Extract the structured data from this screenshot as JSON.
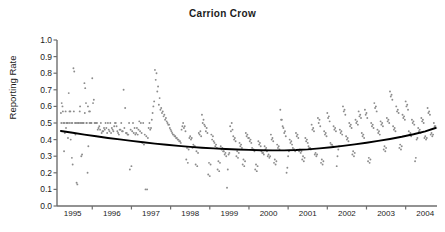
{
  "chart_data": {
    "type": "scatter",
    "title": "Carrion Crow",
    "xlabel": "",
    "ylabel": "Reporting Rate",
    "ylim": [
      0.0,
      1.0
    ],
    "xlim": [
      1994.6,
      2004.3
    ],
    "grid": false,
    "legend": null,
    "yticks": [
      "1.0",
      "0.9",
      "0.8",
      "0.7",
      "0.6",
      "0.5",
      "0.4",
      "0.3",
      "0.2",
      "0.1",
      "0.0"
    ],
    "ytick_values": [
      1.0,
      0.9,
      0.8,
      0.7,
      0.6,
      0.5,
      0.4,
      0.3,
      0.2,
      0.1,
      0.0
    ],
    "xticks": [
      "1995",
      "1996",
      "1997",
      "1998",
      "1999",
      "2000",
      "2001",
      "2002",
      "2003",
      "2004"
    ],
    "xtick_values": [
      1995,
      1996,
      1997,
      1998,
      1999,
      2000,
      2001,
      2002,
      2003,
      2004
    ],
    "point_color": "#8c8c8c",
    "trend_color": "#000000",
    "axis_color": "#6e6e6e",
    "series": [
      {
        "name": "Reporting rate (monthly observations)",
        "type": "scatter",
        "x": [
          1994.7,
          1994.72,
          1994.74,
          1994.76,
          1994.78,
          1994.8,
          1994.82,
          1994.84,
          1994.86,
          1994.88,
          1994.9,
          1994.92,
          1994.94,
          1994.96,
          1994.98,
          1995.0,
          1995.02,
          1995.04,
          1995.06,
          1995.08,
          1995.1,
          1995.12,
          1995.14,
          1995.16,
          1995.18,
          1995.2,
          1995.22,
          1995.24,
          1995.26,
          1995.28,
          1995.3,
          1995.32,
          1995.34,
          1995.36,
          1995.38,
          1995.4,
          1995.42,
          1995.44,
          1995.46,
          1995.48,
          1995.5,
          1995.54,
          1995.58,
          1995.62,
          1995.66,
          1995.7,
          1995.74,
          1995.78,
          1995.82,
          1995.86,
          1995.9,
          1995.94,
          1995.98,
          1996.02,
          1996.06,
          1996.1,
          1996.14,
          1996.18,
          1996.22,
          1996.26,
          1996.3,
          1996.34,
          1996.38,
          1996.42,
          1996.46,
          1996.5,
          1996.54,
          1996.58,
          1996.62,
          1996.66,
          1996.7,
          1996.74,
          1996.78,
          1996.82,
          1996.86,
          1996.9,
          1996.94,
          1996.98,
          1997.02,
          1997.06,
          1997.1,
          1997.14,
          1997.18,
          1997.22,
          1997.26,
          1997.3,
          1997.34,
          1997.38,
          1997.42,
          1997.46,
          1997.5,
          1997.54,
          1997.58,
          1997.62,
          1997.66,
          1997.7,
          1997.74,
          1997.78,
          1997.82,
          1997.86,
          1997.9,
          1997.94,
          1997.98,
          1998.02,
          1998.06,
          1998.1,
          1998.14,
          1998.18,
          1998.22,
          1998.26,
          1998.3,
          1998.34,
          1998.38,
          1998.42,
          1998.46,
          1998.5,
          1998.54,
          1998.58,
          1998.62,
          1998.66,
          1998.7,
          1998.74,
          1998.78,
          1998.82,
          1998.86,
          1998.9,
          1998.94,
          1998.98,
          1999.02,
          1999.06,
          1999.1,
          1999.14,
          1999.18,
          1999.22,
          1999.26,
          1999.3,
          1999.34,
          1999.38,
          1999.42,
          1999.46,
          1999.5,
          1999.54,
          1999.58,
          1999.62,
          1999.66,
          1999.7,
          1999.74,
          1999.78,
          1999.82,
          1999.86,
          1999.9,
          1999.94,
          1999.98,
          2000.02,
          2000.06,
          2000.1,
          2000.14,
          2000.18,
          2000.22,
          2000.26,
          2000.3,
          2000.34,
          2000.38,
          2000.42,
          2000.46,
          2000.5,
          2000.54,
          2000.58,
          2000.62,
          2000.66,
          2000.7,
          2000.74,
          2000.78,
          2000.82,
          2000.86,
          2000.9,
          2000.94,
          2000.98,
          2001.02,
          2001.06,
          2001.1,
          2001.14,
          2001.18,
          2001.22,
          2001.26,
          2001.3,
          2001.34,
          2001.38,
          2001.42,
          2001.46,
          2001.5,
          2001.54,
          2001.58,
          2001.62,
          2001.66,
          2001.7,
          2001.74,
          2001.78,
          2001.82,
          2001.86,
          2001.9,
          2001.94,
          2001.98,
          2002.02,
          2002.06,
          2002.1,
          2002.14,
          2002.18,
          2002.22,
          2002.26,
          2002.3,
          2002.34,
          2002.38,
          2002.42,
          2002.46,
          2002.5,
          2002.54,
          2002.58,
          2002.62,
          2002.66,
          2002.7,
          2002.74,
          2002.78,
          2002.82,
          2002.86,
          2002.9,
          2002.94,
          2002.98,
          2003.02,
          2003.06,
          2003.1,
          2003.14,
          2003.18,
          2003.22,
          2003.26,
          2003.3,
          2003.34,
          2003.38,
          2003.42,
          2003.46,
          2003.5,
          2003.54,
          2003.58,
          2003.62,
          2003.66,
          2003.7,
          2003.74,
          2003.78,
          2003.82,
          2003.86,
          2003.9,
          2003.94,
          2003.98,
          2004.02,
          2004.06,
          2004.1,
          2004.14,
          2004.18,
          2004.22,
          2004.26,
          1994.71,
          1994.75,
          1994.79,
          1994.83,
          1994.87,
          1994.91,
          1994.95,
          1994.99,
          1995.03,
          1995.07,
          1995.11,
          1995.15,
          1995.19,
          1995.23,
          1995.27,
          1995.31,
          1995.35,
          1995.39,
          1995.43,
          1995.47,
          1995.52,
          1995.56,
          1995.6,
          1995.64,
          1995.68,
          1995.72,
          1995.76,
          1995.8,
          1995.84,
          1995.88,
          1995.92,
          1995.96,
          1996.0,
          1996.04,
          1996.08,
          1996.12,
          1996.16,
          1996.2,
          1996.24,
          1996.28,
          1996.32,
          1996.36,
          1996.4,
          1996.44,
          1996.48,
          1996.52,
          1996.56,
          1996.6,
          1996.64,
          1996.68,
          1996.72,
          1996.76,
          1996.8,
          1996.84,
          1996.88,
          1996.92,
          1996.96,
          1997.0,
          1997.04,
          1997.08,
          1997.12,
          1997.16,
          1997.2,
          1997.24,
          1997.28,
          1997.32,
          1997.36,
          1997.4,
          1997.44,
          1997.48,
          1997.52,
          1997.56,
          1997.6,
          1997.64,
          1997.68,
          1997.72,
          1997.76,
          1997.8,
          1997.84,
          1997.88,
          1997.92,
          1997.96,
          1998.0,
          1998.04,
          1998.08,
          1998.12,
          1998.16,
          1998.2,
          1998.24,
          1998.28,
          1998.32,
          1998.36,
          1998.4,
          1998.44,
          1998.48,
          1998.52,
          1998.56,
          1998.6,
          1998.64,
          1998.68,
          1998.72,
          1998.76,
          1998.8,
          1998.84,
          1998.88,
          1998.92,
          1998.96,
          1999.0,
          1999.04,
          1999.08,
          1999.12,
          1999.16,
          1999.2,
          1999.24,
          1999.28,
          1999.32,
          1999.36,
          1999.4,
          1999.44,
          1999.48,
          1999.52,
          1999.56,
          1999.6,
          1999.64,
          1999.68,
          1999.72,
          1999.76,
          1999.8,
          1999.84,
          1999.88,
          1999.92,
          1999.96,
          2000.0,
          2000.04,
          2000.08,
          2000.12,
          2000.16,
          2000.2,
          2000.24,
          2000.28,
          2000.32,
          2000.36,
          2000.4,
          2000.44,
          2000.48,
          2000.52,
          2000.56,
          2000.6,
          2000.64,
          2000.68,
          2000.72,
          2000.76,
          2000.8,
          2000.84,
          2000.88,
          2000.92,
          2000.96,
          2001.0,
          2001.04,
          2001.08,
          2001.12,
          2001.16,
          2001.2,
          2001.24,
          2001.28,
          2001.32,
          2001.36,
          2001.4,
          2001.44,
          2001.48,
          2001.52,
          2001.56,
          2001.6,
          2001.64,
          2001.68,
          2001.72,
          2001.76,
          2001.8,
          2001.84,
          2001.88,
          2001.92,
          2001.96,
          2002.0,
          2002.04,
          2002.08,
          2002.12,
          2002.16,
          2002.2,
          2002.24,
          2002.28,
          2002.32,
          2002.36,
          2002.4,
          2002.44,
          2002.48,
          2002.52,
          2002.56,
          2002.6,
          2002.64,
          2002.68,
          2002.72,
          2002.76,
          2002.8,
          2002.84,
          2002.88,
          2002.92,
          2002.96,
          2003.0,
          2003.04,
          2003.08,
          2003.12,
          2003.16,
          2003.2,
          2003.24,
          2003.28,
          2003.32,
          2003.36,
          2003.4,
          2003.44,
          2003.48,
          2003.52,
          2003.56,
          2003.6,
          2003.64,
          2003.68,
          2003.72,
          2003.76,
          2003.8,
          2003.84,
          2003.88,
          2003.92,
          2003.96,
          2004.0,
          2004.04,
          2004.08,
          2004.12,
          2004.16,
          2004.2,
          2004.24,
          2004.28
        ],
        "y": [
          0.56,
          0.62,
          0.6,
          0.5,
          0.33,
          0.44,
          0.57,
          0.5,
          0.5,
          0.41,
          0.68,
          0.57,
          0.57,
          0.5,
          0.29,
          0.25,
          0.83,
          0.81,
          0.5,
          0.5,
          0.14,
          0.13,
          0.5,
          0.5,
          0.57,
          0.5,
          0.3,
          0.31,
          0.5,
          0.5,
          0.74,
          0.71,
          0.62,
          0.5,
          0.2,
          0.36,
          0.57,
          0.57,
          0.5,
          0.5,
          0.77,
          0.64,
          0.5,
          0.5,
          0.47,
          0.46,
          0.44,
          0.45,
          0.46,
          0.47,
          0.5,
          0.45,
          0.44,
          0.46,
          0.48,
          0.5,
          0.45,
          0.43,
          0.46,
          0.45,
          0.7,
          0.59,
          0.44,
          0.43,
          0.22,
          0.24,
          0.5,
          0.47,
          0.44,
          0.43,
          0.51,
          0.5,
          0.38,
          0.37,
          0.1,
          0.1,
          0.47,
          0.46,
          0.52,
          0.6,
          0.82,
          0.8,
          0.72,
          0.65,
          0.59,
          0.57,
          0.55,
          0.53,
          0.5,
          0.49,
          0.46,
          0.44,
          0.43,
          0.42,
          0.41,
          0.4,
          0.39,
          0.46,
          0.5,
          0.48,
          0.28,
          0.26,
          0.41,
          0.4,
          0.35,
          0.36,
          0.25,
          0.24,
          0.44,
          0.45,
          0.55,
          0.52,
          0.48,
          0.47,
          0.19,
          0.18,
          0.43,
          0.42,
          0.38,
          0.37,
          0.22,
          0.21,
          0.36,
          0.35,
          0.33,
          0.32,
          0.11,
          0.31,
          0.48,
          0.5,
          0.42,
          0.41,
          0.3,
          0.29,
          0.38,
          0.37,
          0.25,
          0.24,
          0.44,
          0.43,
          0.41,
          0.4,
          0.35,
          0.34,
          0.22,
          0.21,
          0.39,
          0.38,
          0.33,
          0.32,
          0.36,
          0.35,
          0.3,
          0.29,
          0.43,
          0.41,
          0.26,
          0.25,
          0.37,
          0.36,
          0.58,
          0.52,
          0.47,
          0.45,
          0.2,
          0.3,
          0.4,
          0.39,
          0.35,
          0.34,
          0.44,
          0.43,
          0.33,
          0.32,
          0.28,
          0.27,
          0.41,
          0.4,
          0.36,
          0.35,
          0.49,
          0.47,
          0.31,
          0.3,
          0.53,
          0.52,
          0.26,
          0.25,
          0.45,
          0.44,
          0.56,
          0.54,
          0.38,
          0.37,
          0.48,
          0.47,
          0.24,
          0.34,
          0.46,
          0.45,
          0.6,
          0.58,
          0.42,
          0.41,
          0.5,
          0.49,
          0.31,
          0.3,
          0.52,
          0.51,
          0.57,
          0.55,
          0.44,
          0.43,
          0.58,
          0.56,
          0.27,
          0.26,
          0.5,
          0.49,
          0.62,
          0.6,
          0.46,
          0.45,
          0.51,
          0.5,
          0.34,
          0.33,
          0.53,
          0.52,
          0.69,
          0.67,
          0.48,
          0.47,
          0.6,
          0.58,
          0.35,
          0.34,
          0.55,
          0.54,
          0.63,
          0.61,
          0.45,
          0.44,
          0.52,
          0.51,
          0.27,
          0.4,
          0.47,
          0.46,
          0.53,
          0.52,
          0.41,
          0.4,
          0.59,
          0.57,
          0.43,
          0.42,
          0.5,
          0.48,
          0.5,
          0.57,
          0.5,
          0.47,
          0.5,
          0.5,
          0.4,
          0.5,
          0.57,
          0.43,
          0.5,
          0.5,
          0.6,
          0.5,
          0.5,
          0.56,
          0.5,
          0.6,
          0.5,
          0.5,
          0.62,
          0.5,
          0.5,
          0.46,
          0.48,
          0.5,
          0.45,
          0.47,
          0.5,
          0.44,
          0.46,
          0.5,
          0.47,
          0.45,
          0.5,
          0.48,
          0.44,
          0.46,
          0.5,
          0.45,
          0.47,
          0.44,
          0.43,
          0.5,
          0.46,
          0.45,
          0.44,
          0.43,
          0.47,
          0.46,
          0.45,
          0.44,
          0.5,
          0.43,
          0.42,
          0.41,
          0.5,
          0.47,
          0.56,
          0.63,
          0.76,
          0.69,
          0.61,
          0.58,
          0.56,
          0.54,
          0.52,
          0.51,
          0.49,
          0.47,
          0.45,
          0.43,
          0.42,
          0.41,
          0.4,
          0.39,
          0.38,
          0.48,
          0.47,
          0.45,
          0.35,
          0.34,
          0.42,
          0.41,
          0.37,
          0.36,
          0.33,
          0.32,
          0.43,
          0.42,
          0.5,
          0.49,
          0.45,
          0.44,
          0.26,
          0.25,
          0.4,
          0.39,
          0.36,
          0.35,
          0.27,
          0.26,
          0.34,
          0.33,
          0.31,
          0.3,
          0.22,
          0.32,
          0.45,
          0.46,
          0.4,
          0.39,
          0.33,
          0.32,
          0.36,
          0.35,
          0.28,
          0.27,
          0.42,
          0.41,
          0.39,
          0.38,
          0.34,
          0.33,
          0.25,
          0.24,
          0.37,
          0.36,
          0.32,
          0.31,
          0.34,
          0.33,
          0.31,
          0.3,
          0.4,
          0.39,
          0.28,
          0.27,
          0.35,
          0.34,
          0.52,
          0.48,
          0.44,
          0.42,
          0.23,
          0.33,
          0.38,
          0.37,
          0.34,
          0.33,
          0.42,
          0.41,
          0.34,
          0.33,
          0.3,
          0.29,
          0.39,
          0.38,
          0.35,
          0.34,
          0.46,
          0.45,
          0.32,
          0.31,
          0.5,
          0.48,
          0.28,
          0.27,
          0.43,
          0.42,
          0.53,
          0.51,
          0.37,
          0.36,
          0.46,
          0.45,
          0.3,
          0.36,
          0.44,
          0.43,
          0.57,
          0.55,
          0.4,
          0.39,
          0.48,
          0.47,
          0.33,
          0.32,
          0.5,
          0.49,
          0.54,
          0.53,
          0.42,
          0.41,
          0.55,
          0.53,
          0.29,
          0.28,
          0.48,
          0.47,
          0.59,
          0.57,
          0.44,
          0.43,
          0.49,
          0.48,
          0.36,
          0.35,
          0.51,
          0.5,
          0.66,
          0.64,
          0.46,
          0.45,
          0.57,
          0.56,
          0.37,
          0.36,
          0.53,
          0.52,
          0.6,
          0.58,
          0.43,
          0.42,
          0.5,
          0.49,
          0.29,
          0.41,
          0.45,
          0.44,
          0.51,
          0.5,
          0.42,
          0.41,
          0.56,
          0.55,
          0.44,
          0.43,
          0.48,
          0.47
        ]
      },
      {
        "name": "Fitted trend",
        "type": "line",
        "x": [
          1994.7,
          1995.0,
          1995.3,
          1995.6,
          1995.9,
          1996.2,
          1996.5,
          1996.8,
          1997.1,
          1997.4,
          1997.7,
          1998.0,
          1998.3,
          1998.6,
          1998.9,
          1999.2,
          1999.5,
          1999.8,
          2000.1,
          2000.4,
          2000.7,
          2001.0,
          2001.3,
          2001.6,
          2001.9,
          2002.2,
          2002.5,
          2002.8,
          2003.1,
          2003.4,
          2003.7,
          2004.0,
          2004.26
        ],
        "y": [
          0.452,
          0.441,
          0.43,
          0.42,
          0.41,
          0.401,
          0.392,
          0.384,
          0.376,
          0.369,
          0.362,
          0.356,
          0.351,
          0.347,
          0.343,
          0.34,
          0.338,
          0.336,
          0.335,
          0.335,
          0.337,
          0.341,
          0.347,
          0.354,
          0.362,
          0.371,
          0.381,
          0.392,
          0.404,
          0.417,
          0.432,
          0.45,
          0.47
        ]
      }
    ]
  }
}
